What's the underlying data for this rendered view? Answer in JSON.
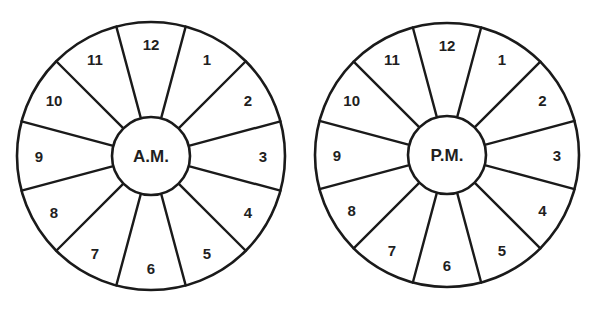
{
  "diagram": {
    "stroke_color": "#1a1a1a",
    "text_color": "#1f1f1f",
    "background": "#ffffff",
    "clocks": [
      {
        "id": "am",
        "center_label": "A.M.",
        "cx": 151,
        "cy": 156,
        "outer_radius": 134,
        "inner_radius": 39,
        "label_radius": 112,
        "segments": [
          "12",
          "1",
          "2",
          "3",
          "4",
          "5",
          "6",
          "7",
          "8",
          "9",
          "10",
          "11"
        ]
      },
      {
        "id": "pm",
        "center_label": "P.M.",
        "cx": 447,
        "cy": 155,
        "outer_radius": 132,
        "inner_radius": 39,
        "label_radius": 110,
        "segments": [
          "12",
          "1",
          "2",
          "3",
          "4",
          "5",
          "6",
          "7",
          "8",
          "9",
          "10",
          "11"
        ]
      }
    ]
  }
}
